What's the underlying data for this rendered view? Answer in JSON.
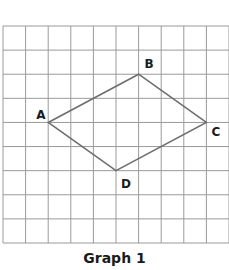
{
  "title": "Graph 1",
  "grid": {
    "columns": 10,
    "rows": 9,
    "left": 3,
    "top": 26,
    "right": 229,
    "bottom": 243,
    "line_color": "#9a9a9a"
  },
  "shape": {
    "stroke_color": "#6e6e6e",
    "vertices": [
      {
        "label": "A",
        "col": 2,
        "row": 4,
        "label_dx": -12,
        "label_dy": -3
      },
      {
        "label": "B",
        "col": 6,
        "row": 2,
        "label_dx": 6,
        "label_dy": -6
      },
      {
        "label": "C",
        "col": 9,
        "row": 4,
        "label_dx": 5,
        "label_dy": 14
      },
      {
        "label": "D",
        "col": 5,
        "row": 6,
        "label_dx": 5,
        "label_dy": 17
      }
    ]
  }
}
